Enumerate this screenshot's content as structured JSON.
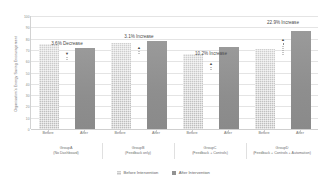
{
  "chart_data": {
    "type": "bar",
    "title": "",
    "xlabel": "",
    "ylabel": "Organisation's Energy Saving Encouragement",
    "ylim": [
      0,
      100
    ],
    "ytick_labels": [
      "100",
      "90",
      "80",
      "70",
      "60",
      "50",
      "40",
      "30",
      "20",
      "10",
      "0"
    ],
    "ytick_values": [
      100,
      90,
      80,
      70,
      60,
      50,
      40,
      30,
      20,
      10,
      0
    ],
    "grid": true,
    "legend_position": "bottom",
    "categories": [
      "GroupA",
      "GroupB",
      "GroupC",
      "GroupD"
    ],
    "category_sublabels": [
      "(No Dashboard)",
      "(Feedback only)",
      "(Feedback + Controls)",
      "(Feedback + Controls + Automation)"
    ],
    "bar_tick_labels": [
      "Before",
      "After",
      "Before",
      "After",
      "Before",
      "After",
      "Before",
      "After"
    ],
    "series": [
      {
        "name": "Before Intervention",
        "values": [
          75,
          76,
          66,
          71
        ],
        "color": "#c6c6c6"
      },
      {
        "name": "After Intervention",
        "values": [
          72,
          78,
          73,
          87
        ],
        "color": "#909090"
      }
    ],
    "annotations": [
      {
        "text": "3.6% Decrease",
        "group": "GroupA",
        "direction": "down"
      },
      {
        "text": "3.1% Increase",
        "group": "GroupB",
        "direction": "up"
      },
      {
        "text": "10.2% Increase",
        "group": "GroupC",
        "direction": "up"
      },
      {
        "text": "22.9% Increase",
        "group": "GroupD",
        "direction": "up"
      }
    ]
  },
  "legend": {
    "items": [
      {
        "label": "Before Intervention"
      },
      {
        "label": "After Intervention"
      }
    ]
  }
}
